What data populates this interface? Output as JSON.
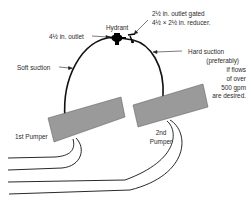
{
  "diagram": {
    "labels": {
      "hydrant": "Hydrant",
      "outlet_large": "4½ in. outlet",
      "outlet_small_line1": "2½ in. outlet gated",
      "outlet_small_line2": "4½ × 2½ in. reducer.",
      "soft_suction": "Soft suction",
      "hard_suction_line1": "Hard suction",
      "hard_suction_line2": "(preferably)",
      "hard_suction_line3": "if flows",
      "hard_suction_line4": "of over",
      "hard_suction_line5": "500 gpm",
      "hard_suction_line6": "are desired.",
      "pumper_1": "1st Pumper",
      "pumper_2_line1": "2nd",
      "pumper_2_line2": "Pumper"
    },
    "colors": {
      "pumper_fill": "#9a9a9a",
      "line": "#111111",
      "text": "#2a2a2a"
    },
    "nodes": [
      {
        "id": "hydrant",
        "type": "hydrant"
      },
      {
        "id": "pumper-1",
        "type": "pumper",
        "label": "1st Pumper"
      },
      {
        "id": "pumper-2",
        "type": "pumper",
        "label": "2nd Pumper"
      }
    ],
    "edges": [
      {
        "from": "hydrant",
        "to": "pumper-1",
        "label": "Soft suction",
        "via": "4½ in. outlet"
      },
      {
        "from": "hydrant",
        "to": "pumper-2",
        "label": "Hard suction (preferably) if flows of over 500 gpm are desired.",
        "via": "2½ in. outlet gated 4½ × 2½ in. reducer."
      }
    ]
  }
}
